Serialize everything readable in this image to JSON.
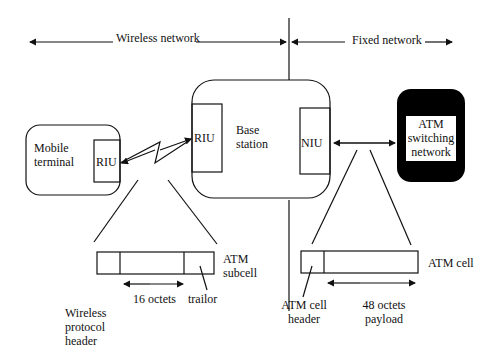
{
  "diagram": {
    "regions": {
      "wireless": "Wireless network",
      "fixed": "Fixed network"
    },
    "nodes": {
      "mobile_terminal": [
        "Mobile",
        "terminal"
      ],
      "mobile_riu": "RIU",
      "base_station": [
        "Base",
        "station"
      ],
      "base_riu": "RIU",
      "base_niu": "NIU",
      "atm_switch": [
        "ATM",
        "switching",
        "network"
      ]
    },
    "packets": {
      "subcell_label": [
        "ATM",
        "subcell"
      ],
      "subcell_size": "16 octets",
      "trailer": "trailor",
      "wireless_header": [
        "Wireless",
        "protocol",
        "header"
      ],
      "cell_label": "ATM cell",
      "cell_header": [
        "ATM cell",
        "header"
      ],
      "cell_payload": [
        "48 octets",
        "payload"
      ]
    },
    "colors": {
      "line": "#111111",
      "switch_fill": "#000000",
      "switch_inner": "#ffffff"
    }
  }
}
